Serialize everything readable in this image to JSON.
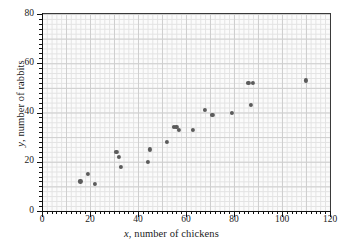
{
  "chart_data": {
    "type": "scatter",
    "title": "",
    "xlabel": "x, number of chickens",
    "ylabel": "y, number of rabbits",
    "xlabel_italic_prefix": "x",
    "xlabel_rest": ", number of chickens",
    "ylabel_italic_prefix": "y",
    "ylabel_rest": ", number of rabbits",
    "xlim": [
      0,
      120
    ],
    "ylim": [
      0,
      80
    ],
    "xticks": [
      0,
      20,
      40,
      60,
      80,
      100,
      120
    ],
    "yticks": [
      0,
      20,
      40,
      60,
      80
    ],
    "xtick_labels": [
      "0",
      "20",
      "40",
      "60",
      "80",
      "100",
      "120"
    ],
    "ytick_labels": [
      "0",
      "20",
      "40",
      "60",
      "80"
    ],
    "x_minor_step": 2,
    "y_minor_step": 2,
    "grid": true,
    "grid_minor": true,
    "legend": null,
    "marker": "circle",
    "marker_color": "#5b5b5b",
    "points": [
      {
        "x": 16,
        "y": 12
      },
      {
        "x": 19,
        "y": 15
      },
      {
        "x": 22,
        "y": 11
      },
      {
        "x": 31,
        "y": 24
      },
      {
        "x": 32,
        "y": 22
      },
      {
        "x": 33,
        "y": 18
      },
      {
        "x": 44,
        "y": 20
      },
      {
        "x": 45,
        "y": 25
      },
      {
        "x": 52,
        "y": 28
      },
      {
        "x": 55,
        "y": 34
      },
      {
        "x": 56,
        "y": 34
      },
      {
        "x": 57,
        "y": 33
      },
      {
        "x": 63,
        "y": 33
      },
      {
        "x": 68,
        "y": 41
      },
      {
        "x": 71,
        "y": 39
      },
      {
        "x": 79,
        "y": 40
      },
      {
        "x": 87,
        "y": 43
      },
      {
        "x": 86,
        "y": 52
      },
      {
        "x": 88,
        "y": 52
      },
      {
        "x": 110,
        "y": 53
      }
    ]
  }
}
